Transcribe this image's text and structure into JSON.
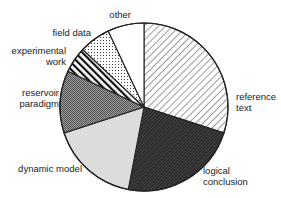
{
  "chart_data": {
    "type": "pie",
    "title": "",
    "start_angle": "top",
    "direction": "clockwise",
    "slices": [
      {
        "label": "reference text",
        "value": 30,
        "pattern": "diagonal-hatch-light"
      },
      {
        "label": "logical conclusion",
        "value": 23,
        "pattern": "diagonal-hatch-dense-dark"
      },
      {
        "label": "dynamic model",
        "value": 17,
        "pattern": "light-gray-solid"
      },
      {
        "label": "reservoir paradigm",
        "value": 12,
        "pattern": "crosshatch-dark-gray"
      },
      {
        "label": "experimental work",
        "value": 5,
        "pattern": "thick-diagonal-stripes"
      },
      {
        "label": "field data",
        "value": 6,
        "pattern": "dotted"
      },
      {
        "label": "other",
        "value": 7,
        "pattern": "white"
      }
    ],
    "labels": [
      {
        "lines": [
          "reference",
          "text"
        ]
      },
      {
        "lines": [
          "logical",
          "conclusion"
        ]
      },
      {
        "lines": [
          "dynamic model"
        ]
      },
      {
        "lines": [
          "reservoir",
          "paradigm"
        ]
      },
      {
        "lines": [
          "experimental",
          "work"
        ]
      },
      {
        "lines": [
          "field data"
        ]
      },
      {
        "lines": [
          "other"
        ]
      }
    ],
    "legend": "none"
  }
}
